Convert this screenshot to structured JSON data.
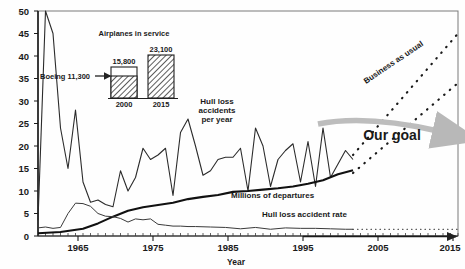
{
  "chart_data": {
    "type": "line",
    "title": "",
    "xlabel": "Year",
    "ylabel": "",
    "xlim": [
      1959,
      2015
    ],
    "ylim": [
      0,
      50
    ],
    "x_ticks": [
      1965,
      1975,
      1985,
      1995,
      2005,
      2015
    ],
    "x_tick_labels": [
      "1965",
      "1975",
      "1985",
      "1995",
      "2005",
      "2015"
    ],
    "y_ticks": [
      0,
      5,
      10,
      15,
      20,
      25,
      30,
      35,
      40,
      45,
      50
    ],
    "y_tick_labels": [
      "0",
      "5",
      "10",
      "15",
      "20",
      "25",
      "30",
      "35",
      "40",
      "45",
      "50"
    ],
    "grid": false,
    "legend_position": "inline-annotations",
    "series": [
      {
        "name": "Hull loss accidents per year",
        "type": "line",
        "x": [
          1959,
          1960,
          1961,
          1962,
          1963,
          1964,
          1965,
          1966,
          1967,
          1968,
          1969,
          1970,
          1971,
          1972,
          1973,
          1974,
          1975,
          1976,
          1977,
          1978,
          1979,
          1980,
          1981,
          1982,
          1983,
          1984,
          1985,
          1986,
          1987,
          1988,
          1989,
          1990,
          1991,
          1992,
          1993,
          1994,
          1995,
          1996,
          1997,
          1998,
          1999,
          2000,
          2001
        ],
        "values": [
          3.5,
          50,
          45,
          24,
          15,
          28,
          12,
          7.5,
          8,
          7,
          6.5,
          14.5,
          10,
          13,
          19.5,
          17,
          18,
          19.5,
          9,
          23,
          26,
          20,
          13.5,
          14.5,
          17,
          17.5,
          17.5,
          19.5,
          10,
          24,
          20,
          11,
          17,
          19,
          20.5,
          12,
          21,
          11,
          24,
          13,
          16,
          19,
          17
        ]
      },
      {
        "name": "Millions of departures",
        "type": "line",
        "x": [
          1959,
          1962,
          1965,
          1967,
          1969,
          1971,
          1973,
          1975,
          1977,
          1979,
          1981,
          1983,
          1985,
          1987,
          1989,
          1991,
          1993,
          1995,
          1997,
          1999,
          2001
        ],
        "values": [
          0.6,
          0.9,
          1.6,
          2.8,
          4.3,
          5.6,
          6.4,
          6.9,
          7.4,
          8.2,
          8.7,
          9.1,
          9.8,
          10.0,
          10.3,
          10.6,
          11.0,
          11.6,
          12.4,
          13.7,
          14.6
        ]
      },
      {
        "name": "Hull loss accident rate",
        "type": "line",
        "x": [
          1959,
          1960,
          1961,
          1962,
          1963,
          1964,
          1965,
          1966,
          1967,
          1968,
          1969,
          1970,
          1971,
          1972,
          1973,
          1974,
          1975,
          1976,
          1977,
          1978,
          1979,
          1980,
          1982,
          1984,
          1986,
          1988,
          1990,
          1992,
          1994,
          1996,
          1998,
          2000,
          2001
        ],
        "values": [
          1.8,
          2.0,
          1.7,
          1.9,
          5.0,
          7.3,
          7.2,
          6.6,
          5.0,
          4.4,
          4.3,
          3.9,
          3.1,
          3.8,
          3.6,
          3.8,
          2.6,
          2.4,
          2.2,
          2.2,
          2.1,
          2.1,
          2.0,
          1.9,
          1.6,
          1.9,
          1.5,
          1.8,
          1.7,
          1.7,
          1.6,
          1.5,
          1.5
        ]
      },
      {
        "name": "Business as usual",
        "type": "dotted-projection",
        "x": [
          2001,
          2015
        ],
        "values": [
          18,
          45
        ]
      },
      {
        "name": "Business as usual lower",
        "type": "dotted-projection",
        "x": [
          2001,
          2015
        ],
        "values": [
          14,
          34
        ]
      },
      {
        "name": "Hull loss accident rate projection",
        "type": "dotted-flat",
        "x": [
          2001,
          2015
        ],
        "values": [
          1.5,
          1.5
        ]
      }
    ],
    "annotations": [
      {
        "name": "hull-loss-accidents-label",
        "text_lines": [
          "Hull loss",
          "accidents",
          "per year"
        ],
        "x": 1987,
        "y": 31
      },
      {
        "name": "millions-of-departures-label",
        "text": "Millions of departures",
        "x": 1993,
        "y": 8.5
      },
      {
        "name": "hull-loss-accident-rate-label",
        "text": "Hull loss accident rate",
        "x": 2000,
        "y": 3.2
      },
      {
        "name": "business-as-usual-label",
        "text": "Business as usual",
        "x": 2008,
        "y": 40
      },
      {
        "name": "our-goal-label",
        "text": "Our goal",
        "x": 2010,
        "y": 17
      }
    ],
    "inset": {
      "title": "Airplanes in service",
      "boeing_label": "Boeing 11,300",
      "bars": [
        {
          "category": "2000",
          "total_label": "15,800",
          "total": 15800,
          "boeing": 11300
        },
        {
          "category": "2015",
          "total_label": "23,100",
          "total": 23100,
          "boeing": 23100
        }
      ]
    },
    "colors": {
      "line": "#262626",
      "departures": "#111111",
      "arrow": "#b0b0b0",
      "text": "#1a1a1a",
      "frame": "#555555"
    }
  }
}
